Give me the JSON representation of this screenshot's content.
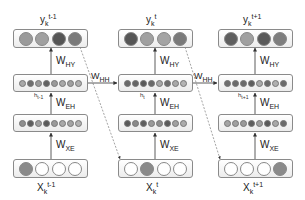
{
  "diagram": {
    "type": "unrolled-recurrent-network",
    "columns": [
      {
        "output_label": {
          "base": "y",
          "sub": "k",
          "sup": "t-1"
        },
        "output_nodes": [
          "#9a9a9a",
          "#a0a0a0",
          "#555555",
          "#7a7a7a"
        ],
        "w_hy": {
          "base": "W",
          "sub": "HY"
        },
        "hidden_label": {
          "base": "h",
          "sub": "t-1"
        },
        "hidden_nodes": [
          "#a8a8a8",
          "#6e6e6e",
          "#9a9a9a",
          "#626262",
          "#9a9a9a",
          "#a8a8a8",
          "#a0a0a0",
          "#b0b0b0"
        ],
        "w_eh": {
          "base": "W",
          "sub": "EH"
        },
        "embed_nodes": [
          "#8e8e8e",
          "#5e5e5e",
          "#a0a0a0",
          "#5a5a5a",
          "#9a9a9a",
          "#a8a8a8",
          "#a4a4a4",
          "#b2b2b2"
        ],
        "w_xe": {
          "base": "W",
          "sub": "XE"
        },
        "input_nodes": [
          "#8a8a8a",
          "#ffffff",
          "#ffffff",
          "#ffffff"
        ],
        "input_label": {
          "base": "X",
          "sub": "k",
          "sup": "t-1"
        }
      },
      {
        "output_label": {
          "base": "y",
          "sub": "k",
          "sup": "t"
        },
        "output_nodes": [
          "#555555",
          "#a0a0a0",
          "#a4a4a4",
          "#7a7a7a"
        ],
        "w_hy": {
          "base": "W",
          "sub": "HY"
        },
        "hidden_label": {
          "base": "h",
          "sub": "t"
        },
        "hidden_nodes": [
          "#6a6a6a",
          "#666666",
          "#5a5a5a",
          "#6a6a6a",
          "#a8a8a8",
          "#6e6e6e",
          "#a8a8a8",
          "#b4b4b4"
        ],
        "w_eh": {
          "base": "W",
          "sub": "EH"
        },
        "embed_nodes": [
          "#5a5a5a",
          "#8a8a8a",
          "#5e5e5e",
          "#9a9a9a",
          "#8e8e8e",
          "#5a5a5a",
          "#a0a0a0",
          "#acacac"
        ],
        "w_xe": {
          "base": "W",
          "sub": "XE"
        },
        "input_nodes": [
          "#ffffff",
          "#8a8a8a",
          "#ffffff",
          "#ffffff"
        ],
        "input_label": {
          "base": "X",
          "sub": "k",
          "sup": "t"
        }
      },
      {
        "output_label": {
          "base": "y",
          "sub": "k",
          "sup": "t+1"
        },
        "output_nodes": [
          "#5e5e5e",
          "#a0a0a0",
          "#5a5a5a",
          "#7e7e7e"
        ],
        "w_hy": {
          "base": "W",
          "sub": "HY"
        },
        "hidden_label": {
          "base": "h",
          "sub": "t+1"
        },
        "hidden_nodes": [
          "#6e6e6e",
          "#6a6a6a",
          "#6a6a6a",
          "#5e5e5e",
          "#aaaaaa",
          "#6a6a6a",
          "#b0b0b0",
          "#6a6a6a"
        ],
        "w_eh": {
          "base": "W",
          "sub": "EH"
        },
        "embed_nodes": [
          "#a4a4a4",
          "#a0a0a0",
          "#9a9a9a",
          "#5e5e5e",
          "#9e9e9e",
          "#5a5a5a",
          "#a8a8a8",
          "#6a6a6a"
        ],
        "w_xe": {
          "base": "W",
          "sub": "XE"
        },
        "input_nodes": [
          "#ffffff",
          "#ffffff",
          "#ffffff",
          "#8a8a8a"
        ],
        "input_label": {
          "base": "X",
          "sub": "k",
          "sup": "t+1"
        }
      }
    ],
    "recurrent_edges": [
      {
        "label": {
          "base": "W",
          "sub": "HH"
        }
      },
      {
        "label": {
          "base": "W",
          "sub": "HH"
        }
      }
    ],
    "colors": {
      "box_border": "#8a8a8a",
      "arrow": "#333333",
      "dashed": "#666666"
    }
  }
}
